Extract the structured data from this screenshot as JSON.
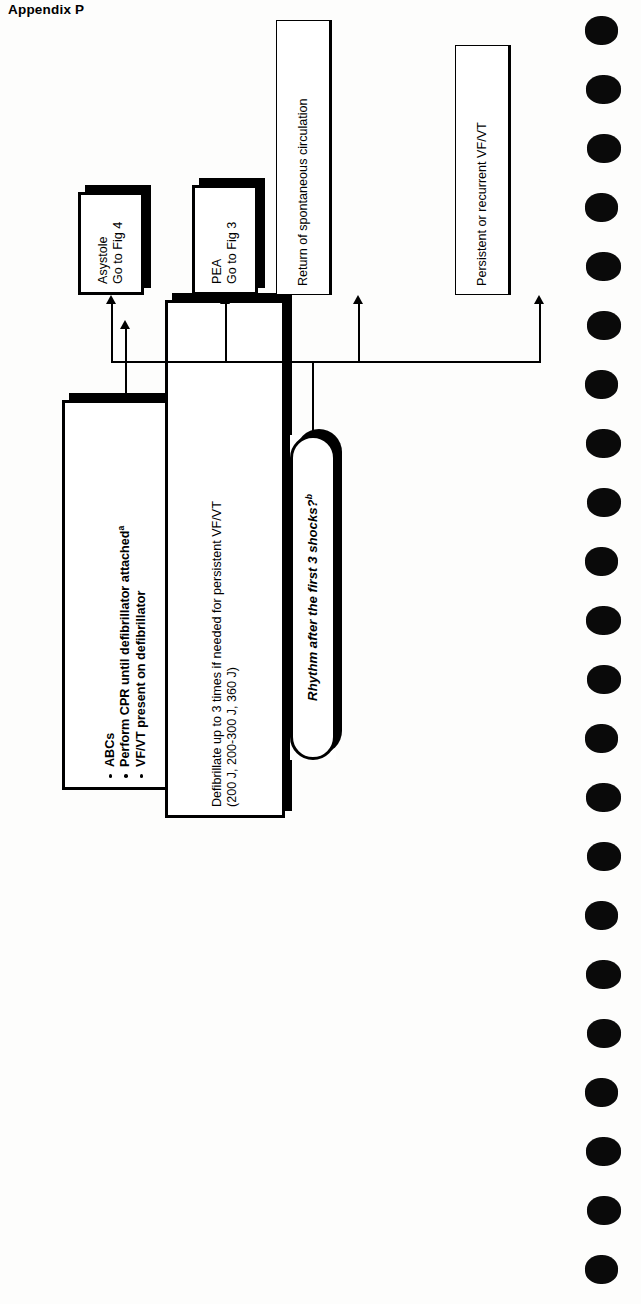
{
  "page": {
    "title": "Appendix P",
    "background_color": "#fdfdfc",
    "ink_color": "#000000"
  },
  "flowchart": {
    "orientation": "rotated-90-ccw",
    "box_initial": {
      "name": "initial-assessment",
      "bullets": [
        {
          "text": "ABCs",
          "footnote": ""
        },
        {
          "text": "Perform CPR until defibrillator attached",
          "footnote": "a"
        },
        {
          "text": "VF/VT present on defibrillator",
          "footnote": ""
        }
      ]
    },
    "box_defibrillate": {
      "name": "defibrillate",
      "lead": "Defibrillate",
      "line1_rest": " up to 3 times if needed for persistent VF/VT",
      "line2": "(200 J, 200-300 J, 360 J)"
    },
    "decision": {
      "name": "rhythm-check",
      "text": "Rhythm after the first 3 shocks?",
      "footnote": "b"
    },
    "outcomes": [
      {
        "name": "asystole",
        "style": "heavy",
        "lines": [
          "Asystole",
          "Go to Fig 4"
        ]
      },
      {
        "name": "pea",
        "style": "heavy",
        "lines": [
          "PEA",
          "Go to Fig 3"
        ]
      },
      {
        "name": "rosc",
        "style": "light",
        "lines": [
          "Return of spontaneous circulation"
        ]
      },
      {
        "name": "persistent-vf-vt",
        "style": "light",
        "lines": [
          "Persistent or recurrent VF/VT"
        ]
      }
    ]
  },
  "binding": {
    "hole_count": 22,
    "color": "#0a0a0a"
  }
}
